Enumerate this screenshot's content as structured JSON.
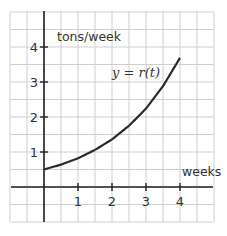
{
  "chart_data": {
    "type": "line",
    "title": "",
    "xlabel": "weeks",
    "ylabel": "tons/week",
    "curve_label": "y = r(t)",
    "x_ticks": [
      1,
      2,
      3,
      4
    ],
    "y_ticks": [
      1,
      2,
      3,
      4
    ],
    "xlim": [
      -1,
      5
    ],
    "ylim": [
      -1,
      5
    ],
    "grid": true,
    "grid_step": 0.5,
    "series": [
      {
        "name": "y = r(t)",
        "x": [
          0,
          0.5,
          1,
          1.5,
          2,
          2.5,
          3,
          3.5,
          4
        ],
        "values": [
          0.5,
          0.64,
          0.82,
          1.06,
          1.36,
          1.75,
          2.24,
          2.88,
          3.69
        ]
      }
    ]
  },
  "labels": {
    "y_axis": "tons/week",
    "x_axis": "weeks",
    "curve": "y = r(t)",
    "xtick_1": "1",
    "xtick_2": "2",
    "xtick_3": "3",
    "xtick_4": "4",
    "ytick_1": "1",
    "ytick_2": "2",
    "ytick_3": "3",
    "ytick_4": "4"
  }
}
